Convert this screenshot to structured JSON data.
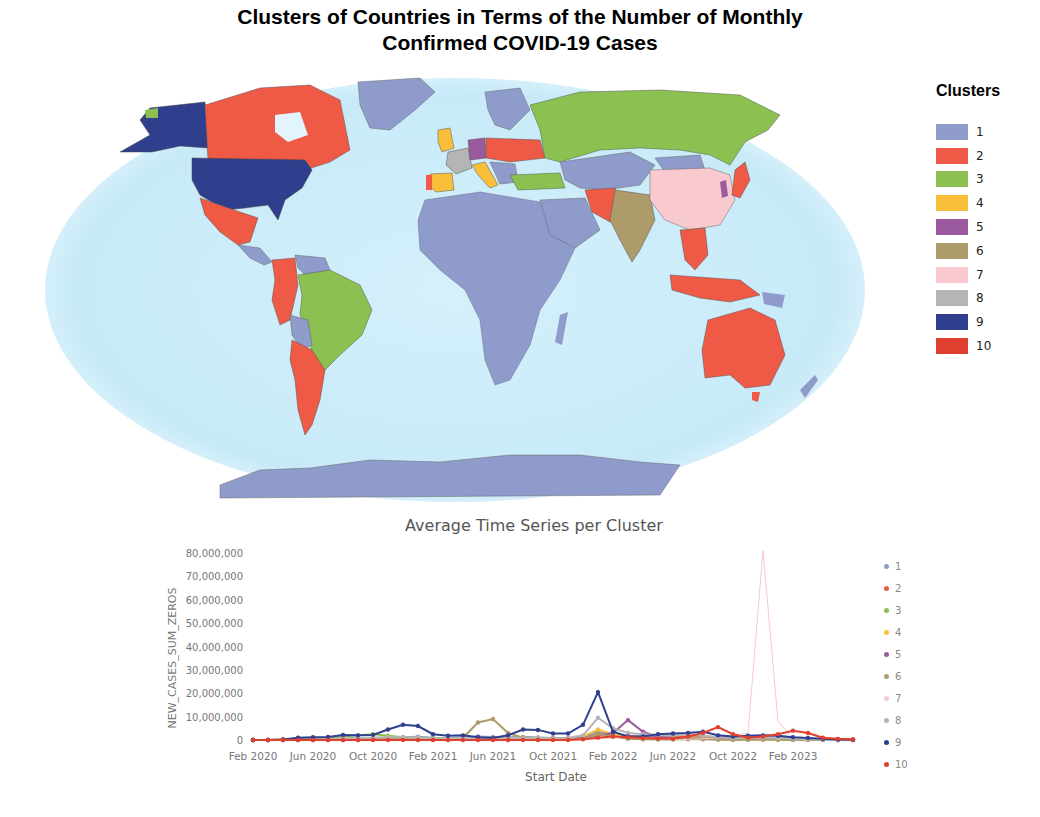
{
  "title_line1": "Clusters of Countries in Terms of the Number of Monthly",
  "title_line2": "Confirmed COVID-19 Cases",
  "map": {
    "legend_title": "Clusters",
    "clusters": [
      {
        "label": "1",
        "color": "#8e9bcb"
      },
      {
        "label": "2",
        "color": "#ee5a45"
      },
      {
        "label": "3",
        "color": "#8cc152"
      },
      {
        "label": "4",
        "color": "#f9bf3b"
      },
      {
        "label": "5",
        "color": "#9b5a9e"
      },
      {
        "label": "6",
        "color": "#ad9b69"
      },
      {
        "label": "7",
        "color": "#f8c9cf"
      },
      {
        "label": "8",
        "color": "#b5b5b5"
      },
      {
        "label": "9",
        "color": "#2f3f8e"
      },
      {
        "label": "10",
        "color": "#e0402f"
      }
    ],
    "ocean_color": "#cfeefa"
  },
  "chart_data": {
    "type": "line",
    "title": "Average Time Series per Cluster",
    "xlabel": "Start Date",
    "ylabel": "NEW_CASES_SUM_ZEROS",
    "ylim": [
      0,
      80000000
    ],
    "y_ticks": [
      "0",
      "10,000,000",
      "20,000,000",
      "30,000,000",
      "40,000,000",
      "50,000,000",
      "60,000,000",
      "70,000,000",
      "80,000,000"
    ],
    "x_tick_labels": [
      "Feb 2020",
      "Jun 2020",
      "Oct 2020",
      "Feb 2021",
      "Jun 2021",
      "Oct 2021",
      "Feb 2022",
      "Jun 2022",
      "Oct 2022",
      "Feb 2023"
    ],
    "x": [
      "2020-02",
      "2020-03",
      "2020-04",
      "2020-05",
      "2020-06",
      "2020-07",
      "2020-08",
      "2020-09",
      "2020-10",
      "2020-11",
      "2020-12",
      "2021-01",
      "2021-02",
      "2021-03",
      "2021-04",
      "2021-05",
      "2021-06",
      "2021-07",
      "2021-08",
      "2021-09",
      "2021-10",
      "2021-11",
      "2021-12",
      "2022-01",
      "2022-02",
      "2022-03",
      "2022-04",
      "2022-05",
      "2022-06",
      "2022-07",
      "2022-08",
      "2022-09",
      "2022-10",
      "2022-11",
      "2022-12",
      "2023-01",
      "2023-02",
      "2023-03",
      "2023-04",
      "2023-05",
      "2023-06"
    ],
    "grid": false,
    "legend_position": "right",
    "series": [
      {
        "name": "1",
        "color": "#8e9bcb",
        "values": [
          0,
          0,
          0.1,
          0.2,
          0.3,
          0.4,
          0.5,
          0.6,
          0.8,
          1.0,
          1.2,
          1.4,
          1.0,
          0.9,
          1.2,
          1.5,
          1.3,
          1.2,
          1.3,
          1.1,
          0.9,
          0.8,
          1.2,
          3.5,
          2.5,
          1.8,
          1.5,
          1.3,
          1.2,
          1.4,
          1.6,
          1.3,
          1.0,
          1.1,
          1.3,
          1.0,
          0.7,
          0.5,
          0.3,
          0.2,
          0.1
        ]
      },
      {
        "name": "2",
        "color": "#ee5a45",
        "values": [
          0,
          0,
          0.1,
          0.1,
          0.2,
          0.3,
          0.4,
          0.4,
          0.5,
          0.6,
          0.6,
          0.7,
          0.5,
          0.5,
          0.6,
          0.7,
          0.6,
          0.8,
          1.0,
          0.9,
          0.7,
          0.6,
          0.8,
          2.5,
          2.0,
          1.5,
          1.2,
          1.0,
          1.2,
          1.5,
          1.3,
          0.9,
          0.7,
          0.8,
          0.9,
          0.6,
          0.4,
          0.3,
          0.2,
          0.1,
          0.1
        ]
      },
      {
        "name": "3",
        "color": "#8cc152",
        "values": [
          0,
          0,
          0.1,
          0.3,
          0.6,
          1.0,
          1.5,
          2.0,
          2.5,
          1.8,
          1.2,
          1.0,
          0.8,
          0.7,
          0.9,
          1.0,
          0.8,
          0.9,
          1.1,
          0.9,
          0.7,
          0.6,
          0.8,
          2.0,
          1.5,
          1.0,
          0.7,
          0.5,
          0.6,
          0.8,
          0.6,
          0.4,
          0.3,
          0.4,
          0.5,
          0.3,
          0.2,
          0.1,
          0.1,
          0.1,
          0.0
        ]
      },
      {
        "name": "4",
        "color": "#f9bf3b",
        "values": [
          0,
          0,
          0.1,
          0.1,
          0.1,
          0.2,
          0.3,
          0.5,
          0.8,
          1.0,
          1.0,
          0.9,
          0.4,
          0.3,
          0.3,
          0.3,
          0.4,
          0.8,
          0.6,
          0.4,
          0.3,
          0.5,
          1.5,
          4.5,
          2.5,
          1.0,
          0.6,
          0.4,
          0.5,
          0.7,
          0.5,
          0.3,
          0.2,
          0.3,
          0.3,
          0.2,
          0.1,
          0.1,
          0.0,
          0.0,
          0.0
        ]
      },
      {
        "name": "5",
        "color": "#9b5a9e",
        "values": [
          0,
          0,
          0,
          0,
          0,
          0,
          0,
          0,
          0.2,
          0.5,
          0.6,
          0.5,
          0.3,
          0.3,
          0.4,
          0.3,
          0.2,
          0.2,
          0.3,
          0.4,
          0.5,
          0.6,
          0.8,
          2.0,
          3.0,
          8.5,
          3.5,
          1.2,
          0.6,
          0.5,
          0.4,
          0.3,
          0.3,
          0.3,
          0.4,
          0.3,
          0.2,
          0.1,
          0.1,
          0.0,
          0.0
        ]
      },
      {
        "name": "6",
        "color": "#ad9b69",
        "values": [
          0,
          0,
          0,
          0.1,
          0.2,
          0.4,
          0.6,
          0.8,
          0.6,
          0.4,
          0.3,
          0.3,
          0.2,
          0.3,
          1.0,
          7.5,
          9.0,
          3.0,
          1.0,
          0.8,
          0.6,
          0.4,
          0.5,
          2.5,
          1.5,
          0.5,
          0.3,
          0.2,
          0.2,
          0.3,
          0.3,
          0.2,
          0.1,
          0.1,
          0.1,
          0.1,
          0.0,
          0.0,
          0.0,
          0.0,
          0.0
        ]
      },
      {
        "name": "7",
        "color": "#f8c9cf",
        "values": [
          0,
          0,
          0,
          0,
          0,
          0,
          0,
          0,
          0,
          0,
          0,
          0,
          0,
          0,
          0,
          0,
          0,
          0,
          0,
          0,
          0,
          0,
          0.1,
          0.5,
          0.8,
          1.5,
          1.2,
          0.5,
          0.3,
          0.3,
          0.5,
          1.0,
          2.0,
          3.0,
          81.0,
          8.0,
          1.0,
          0.3,
          0.2,
          0.1,
          0.1
        ]
      },
      {
        "name": "8",
        "color": "#b5b5b5",
        "values": [
          0,
          0,
          0,
          0.1,
          0.2,
          0.4,
          0.6,
          0.8,
          1.0,
          1.2,
          1.2,
          1.0,
          0.6,
          0.8,
          1.0,
          0.9,
          0.7,
          0.8,
          0.9,
          0.8,
          0.6,
          0.8,
          2.0,
          9.5,
          5.0,
          3.0,
          2.5,
          2.2,
          2.0,
          2.0,
          1.8,
          1.2,
          0.8,
          0.9,
          1.0,
          0.8,
          0.5,
          0.3,
          0.2,
          0.1,
          0.1
        ]
      },
      {
        "name": "9",
        "color": "#2f3f8e",
        "values": [
          0,
          0,
          0.2,
          1.0,
          1.2,
          1.3,
          2.2,
          2.0,
          2.2,
          4.5,
          6.5,
          6.0,
          2.5,
          1.8,
          2.0,
          1.2,
          0.8,
          2.0,
          4.5,
          4.3,
          2.8,
          2.8,
          6.5,
          20.5,
          3.5,
          1.5,
          1.5,
          2.5,
          2.8,
          3.0,
          3.5,
          2.0,
          1.5,
          1.8,
          2.0,
          1.8,
          1.2,
          0.9,
          0.5,
          0.2,
          0.1
        ]
      },
      {
        "name": "10",
        "color": "#e0402f",
        "values": [
          0,
          0,
          0,
          0,
          0,
          0,
          0,
          0,
          0,
          0,
          0,
          0,
          0,
          0,
          0,
          0,
          0,
          0,
          0,
          0,
          0,
          0,
          0.3,
          1.0,
          1.5,
          1.2,
          0.8,
          0.6,
          0.5,
          1.5,
          3.0,
          5.5,
          2.5,
          1.0,
          1.5,
          2.5,
          4.0,
          3.0,
          1.0,
          0.5,
          0.2
        ]
      }
    ],
    "values_unit": "millions",
    "legend_labels": [
      "1",
      "2",
      "3",
      "4",
      "5",
      "6",
      "7",
      "8",
      "9",
      "10"
    ]
  }
}
